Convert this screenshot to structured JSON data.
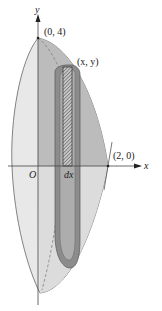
{
  "figure": {
    "axes": {
      "x_label": "x",
      "y_label": "y",
      "origin_label": "O"
    },
    "points": [
      {
        "label": "(0, 4)",
        "role": "apex"
      },
      {
        "label": "(x, y)",
        "role": "shell-top"
      },
      {
        "label": "(2, 0)",
        "role": "x-intercept"
      }
    ],
    "strip_label": "dx",
    "colors": {
      "outer_light": "#e6e6e6",
      "front_region": "#bdbdbd",
      "shell_band": "#8a8a8a",
      "shell_inner": "#b0b0b0",
      "curve_stroke": "#555555",
      "hatch": "#444444"
    }
  }
}
